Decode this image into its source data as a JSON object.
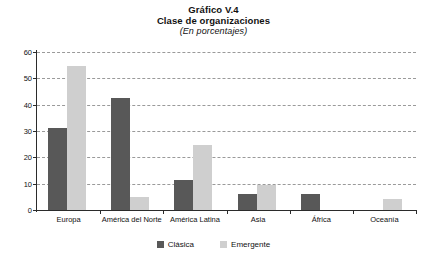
{
  "chart_data": {
    "type": "bar",
    "title": "Gráfico V.4",
    "subtitle": "Clase de organizaciones",
    "units": "(En porcentajes)",
    "xlabel": "",
    "ylabel": "",
    "ylim": [
      0,
      60
    ],
    "yticks": [
      0,
      10,
      20,
      30,
      40,
      50,
      60
    ],
    "ytick_labels": [
      "0",
      "10",
      "20",
      "30",
      "40",
      "50",
      "60"
    ],
    "grid": true,
    "legend_position": "bottom",
    "categories": [
      "Europa",
      "América del Norte",
      "América Latina",
      "Asia",
      "África",
      "Oceanía"
    ],
    "series": [
      {
        "name": "Clásica",
        "color": "#585858",
        "values": [
          31,
          42.5,
          11.5,
          6,
          6,
          0
        ]
      },
      {
        "name": "Emergente",
        "color": "#cfcfcf",
        "values": [
          54.5,
          5,
          24.5,
          9.5,
          0,
          4
        ]
      }
    ]
  },
  "legend": {
    "items": [
      {
        "label": "Clásica",
        "swatch": "clasica"
      },
      {
        "label": "Emergente",
        "swatch": "emergente"
      }
    ]
  },
  "colors": {
    "clasica": "#585858",
    "emergente": "#cfcfcf",
    "axis": "#2b2b2b",
    "grid": "#9a9a9a",
    "background": "#ffffff"
  }
}
